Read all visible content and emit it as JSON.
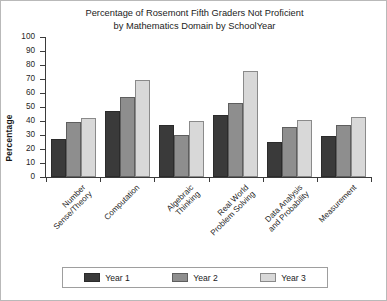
{
  "chart_data": {
    "type": "bar",
    "title": "Percentage of Rosemont Fifth Graders Not Proficient by Mathematics Domain by SchoolYear",
    "title_lines": [
      "Percentage of Rosemont Fifth Graders Not Proficient",
      "by Mathematics Domain by SchoolYear"
    ],
    "xlabel": "",
    "ylabel": "Percentage",
    "ylim": [
      0,
      100
    ],
    "ytick_step": 10,
    "yticks": [
      0,
      10,
      20,
      30,
      40,
      50,
      60,
      70,
      80,
      90,
      100
    ],
    "grid": false,
    "legend_position": "bottom",
    "categories": [
      "Number Sense/Theory",
      "Computation",
      "Algebraic Thinking",
      "Real World Problem Solving",
      "Data Analysis and Probability",
      "Measurement"
    ],
    "category_lines": [
      [
        "Number",
        "Sense/Theory"
      ],
      [
        "Computation"
      ],
      [
        "Algebraic",
        "Thinking"
      ],
      [
        "Real World",
        "Problem Solving"
      ],
      [
        "Data Analysis",
        "and Probability"
      ],
      [
        "Measurement"
      ]
    ],
    "series": [
      {
        "name": "Year 1",
        "color": "#3a3a3a",
        "values": [
          27,
          47,
          37,
          44,
          25,
          29
        ]
      },
      {
        "name": "Year 2",
        "color": "#8e8e8e",
        "values": [
          39,
          57,
          30,
          53,
          36,
          37
        ]
      },
      {
        "name": "Year 3",
        "color": "#d8d8d8",
        "values": [
          42,
          69,
          40,
          76,
          41,
          43
        ]
      }
    ]
  },
  "legend": {
    "items": [
      {
        "label": "Year 1"
      },
      {
        "label": "Year 2"
      },
      {
        "label": "Year 3"
      }
    ]
  }
}
